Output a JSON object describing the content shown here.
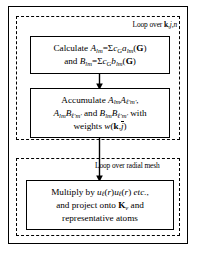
{
  "diagram": {
    "type": "flowchart",
    "frame": {
      "style": "solid",
      "color": "#000000"
    },
    "loops": [
      {
        "id": "loop-kjn",
        "label": "Loop over k,j,n",
        "label_parts": {
          "prefix": "Loop over ",
          "vector": "k",
          "indices": ",j,n"
        },
        "border_style": "dashed",
        "contains": [
          "box-calculate",
          "box-accumulate"
        ]
      },
      {
        "id": "loop-radial",
        "label": "Loop over radial mesh",
        "border_style": "dashed",
        "contains": [
          "box-multiply"
        ]
      }
    ],
    "boxes": [
      {
        "id": "box-calculate",
        "name": "calculate-coefficients-box",
        "lines": [
          "Calculate A_lm = Σ c_G a_lm(G)",
          "and B_lm = Σ c_G b_lm(G)"
        ],
        "plain_text": "Calculate Alm=ΣcG alm(G) and Blm=ΣcG blm(G)"
      },
      {
        "id": "box-accumulate",
        "name": "accumulate-products-box",
        "lines": [
          "Accumulate A_lm A_l'm',",
          "A_lm B_l'm' and B_lm B_l'm' with",
          "weights w(k,j̄)"
        ],
        "plain_text": "Accumulate AlmAl'm', AlmBl'm' and BlmBl'm' with weights w(k,j)"
      },
      {
        "id": "box-multiply",
        "name": "multiply-project-box",
        "lines": [
          "Multiply by u_l(r)u_l(r) etc.,",
          "and project onto K_v and",
          "representative atoms"
        ],
        "plain_text": "Multiply by ul(r)ul(r) etc., and project onto Kv and representative atoms"
      }
    ],
    "arrows": [
      {
        "id": "arrow-calc-to-accum",
        "from": "box-calculate",
        "to": "box-accumulate",
        "direction": "down"
      },
      {
        "id": "arrow-accum-to-mult",
        "from": "box-accumulate",
        "to": "box-multiply",
        "direction": "down"
      }
    ],
    "colors": {
      "stroke": "#000000",
      "background": "#ffffff"
    }
  }
}
